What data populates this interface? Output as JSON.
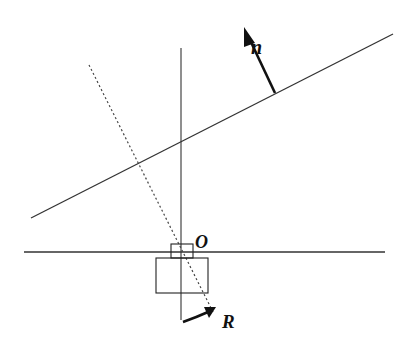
{
  "figure": {
    "labels": {
      "normal": "n",
      "origin": "O",
      "rotation": "R"
    },
    "colors": {
      "line": "#222222",
      "thin_line": "#333333",
      "dotted": "#444444",
      "background": "#ffffff"
    },
    "geometry": {
      "vertical_axis": {
        "x1": 181,
        "y1": 48,
        "x2": 181,
        "y2": 320
      },
      "horizontal_axis": {
        "x1": 24,
        "y1": 252,
        "x2": 385,
        "y2": 252
      },
      "inclined_line": {
        "x1": 31,
        "y1": 218,
        "x2": 393,
        "y2": 34
      },
      "dotted_line": {
        "x1": 89,
        "y1": 65,
        "x2": 213,
        "y2": 312
      },
      "small_box": {
        "x": 171,
        "y": 244,
        "w": 22,
        "h": 14
      },
      "large_box": {
        "x": 156,
        "y": 258,
        "w": 52,
        "h": 35
      },
      "normal_arrow": {
        "x1": 275,
        "y1": 93,
        "x2": 246,
        "y2": 32
      }
    }
  }
}
